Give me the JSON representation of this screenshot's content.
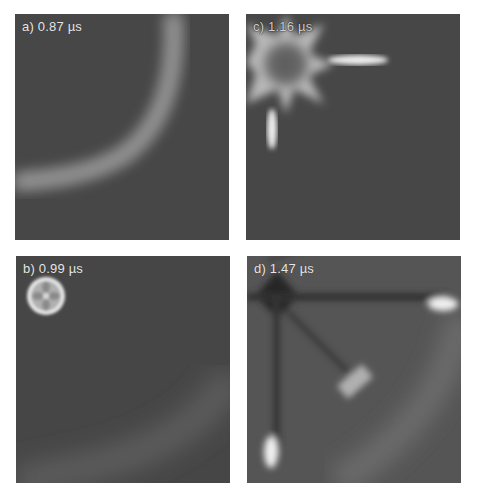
{
  "figure": {
    "panels": [
      {
        "id": "a",
        "label": "a) 0.87 µs",
        "time_us": 0.87,
        "position": "top-left"
      },
      {
        "id": "b",
        "label": "b) 0.99 µs",
        "time_us": 0.99,
        "position": "bottom-left"
      },
      {
        "id": "c",
        "label": "c) 1.16 µs",
        "time_us": 1.16,
        "position": "top-right"
      },
      {
        "id": "d",
        "label": "d) 1.47 µs",
        "time_us": 1.47,
        "position": "bottom-right"
      }
    ],
    "colors": {
      "background": "#ffffff",
      "panel_background": "#4a4a4a",
      "highlight": "#f2f2f2",
      "shadow": "#2a2a2a"
    }
  }
}
